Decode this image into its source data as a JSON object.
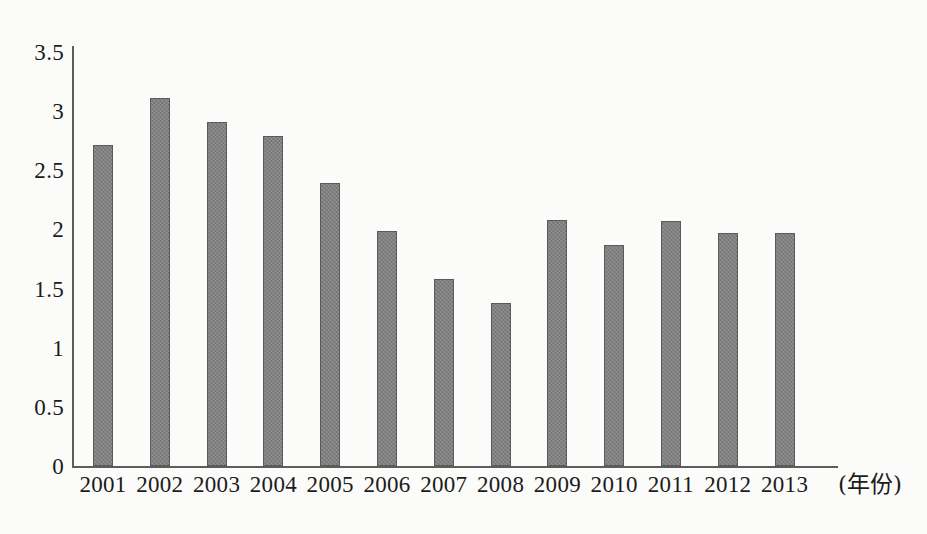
{
  "chart_data": {
    "type": "bar",
    "title": "",
    "subtitle": "",
    "xlabel": "(年份)",
    "ylabel": "",
    "categories": [
      "2001",
      "2002",
      "2003",
      "2004",
      "2005",
      "2006",
      "2007",
      "2008",
      "2009",
      "2010",
      "2011",
      "2012",
      "2013"
    ],
    "values": [
      2.71,
      3.11,
      2.91,
      2.79,
      2.39,
      1.99,
      1.58,
      1.38,
      2.08,
      1.87,
      2.07,
      1.97,
      1.97
    ],
    "series": [
      {
        "name": "",
        "values": [
          2.71,
          3.11,
          2.91,
          2.79,
          2.39,
          1.99,
          1.58,
          1.38,
          2.08,
          1.87,
          2.07,
          1.97,
          1.97
        ]
      }
    ],
    "ylim": [
      0,
      3.5
    ],
    "ytick_labels": [
      "3.5",
      "3",
      "2.5",
      "2",
      "1.5",
      "1",
      "0.5",
      "0"
    ],
    "ytick_values": [
      3.5,
      3,
      2.5,
      2,
      1.5,
      1,
      0.5,
      0
    ],
    "grid": false,
    "legend": false,
    "legend_position": "none",
    "bar_color": "#7e7e7e",
    "bar_border_color": "#5a5a5a",
    "axis_color": "#5d5d5d",
    "background_color": "#fbfbfa",
    "text_color": "#1b1b1b",
    "annotations": []
  }
}
